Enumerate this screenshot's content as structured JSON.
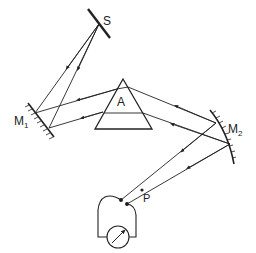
{
  "diagram": {
    "labels": {
      "source": "S",
      "mirror1": "M",
      "mirror1_sub": "1",
      "prism": "A",
      "mirror2": "M",
      "mirror2_sub": "2",
      "detector_point": "P"
    },
    "components": [
      {
        "id": "source-slit",
        "label": "S"
      },
      {
        "id": "mirror-1",
        "label": "M1",
        "type": "plane mirror"
      },
      {
        "id": "prism",
        "label": "A"
      },
      {
        "id": "mirror-2",
        "label": "M2",
        "type": "concave mirror"
      },
      {
        "id": "thermocouple-junction",
        "label": "P"
      },
      {
        "id": "galvanometer",
        "label": ""
      }
    ],
    "colors": {
      "line": "#222222",
      "background": "#ffffff"
    }
  }
}
